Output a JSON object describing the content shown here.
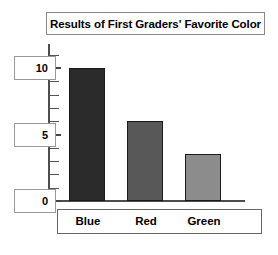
{
  "chart_data": {
    "type": "bar",
    "title": "Results of First Graders' Favorite Color",
    "categories": [
      "Blue",
      "Red",
      "Green"
    ],
    "values": [
      10,
      6,
      3.5
    ],
    "series": [
      {
        "name": "Number of First Graders",
        "values": [
          10,
          6,
          3.5
        ]
      }
    ],
    "xlabel": "",
    "ylabel": "",
    "ylim": [
      0,
      11
    ],
    "y_tick_labels": [
      "0",
      "5",
      "10"
    ],
    "y_tick_values": [
      0,
      5,
      10
    ],
    "y_minor_tick_values": [
      1,
      2,
      3,
      4,
      6,
      7,
      8,
      9,
      11
    ],
    "grid": false,
    "legend": false,
    "legend_position": "none",
    "bar_colors": [
      "#2b2b2b",
      "#585858",
      "#8c8c8c"
    ],
    "bar_border_color": "#1a1a1a",
    "axis_color": "#4d4d4d",
    "background_color": "#ffffff",
    "text_color": "#000000"
  },
  "figure": {
    "title_box_border": "#888888",
    "category_box_border": "#666666",
    "label_box_border": "#999999"
  }
}
